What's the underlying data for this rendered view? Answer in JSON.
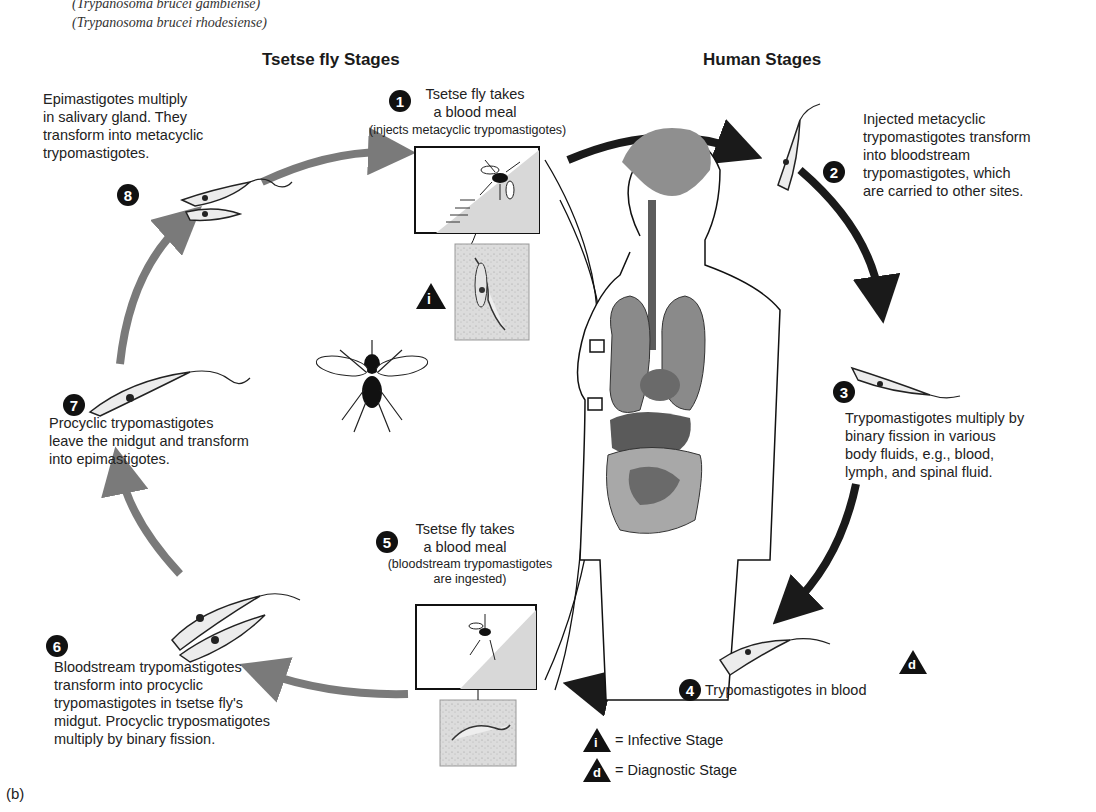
{
  "header": {
    "species_1": "(Trypanosoma brucei gambiense)",
    "species_2": "(Trypanosoma brucei rhodesiense)",
    "tsetse_heading": "Tsetse fly Stages",
    "human_heading": "Human Stages"
  },
  "stages": [
    {
      "number": "1",
      "title_line1": "Tsetse fly takes",
      "title_line2": "a blood meal",
      "note": "(injects metacyclic trypomastigotes)"
    },
    {
      "number": "2",
      "lines": [
        "Injected metacyclic",
        "trypomastigotes transform",
        "into bloodstream",
        "trypomastigotes, which",
        "are carried to other sites."
      ]
    },
    {
      "number": "3",
      "lines": [
        "Trypomastigotes multiply by",
        "binary fission in various",
        "body fluids, e.g., blood,",
        "lymph, and spinal fluid."
      ]
    },
    {
      "number": "4",
      "text": "Trypomastigotes in blood"
    },
    {
      "number": "5",
      "title_line1": "Tsetse fly takes",
      "title_line2": "a blood meal",
      "note_line1": "(bloodstream trypomastigotes",
      "note_line2": "are ingested)"
    },
    {
      "number": "6",
      "lines": [
        "Bloodstream trypomastigotes",
        "transform into procyclic",
        "trypomastigotes in tsetse fly's",
        "midgut. Procyclic tryposmatigotes",
        "multiply by binary fission."
      ]
    },
    {
      "number": "7",
      "lines": [
        "Procyclic trypomastigotes",
        "leave the midgut and transform",
        "into epimastigotes."
      ]
    },
    {
      "number": "8",
      "lines": [
        "Epimastigotes multiply",
        "in salivary gland. They",
        "transform into metacyclic",
        "trypomastigotes."
      ]
    }
  ],
  "legend": {
    "infective_symbol": "i",
    "infective_label": "= Infective Stage",
    "diagnostic_symbol": "d",
    "diagnostic_label": "= Diagnostic Stage"
  },
  "figure_label": "(b)",
  "colors": {
    "human_arrow": "#1a1a1a",
    "tsetse_arrow": "#7a7a7a",
    "organ_dark": "#6a6a6a",
    "organ_light": "#a8a8a8",
    "inset_bg": "#e2e2e2"
  }
}
